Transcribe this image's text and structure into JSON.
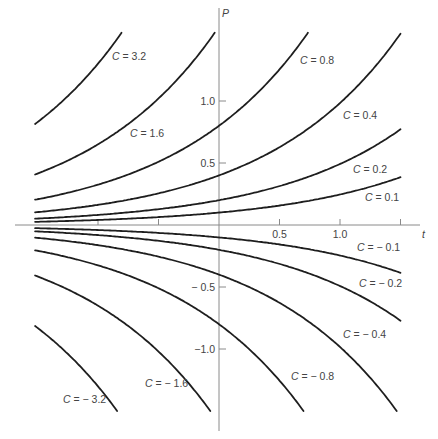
{
  "chart_data": {
    "type": "line",
    "title": "",
    "xlabel": "t",
    "ylabel": "P",
    "equation_form": "P = C·e^(k t)",
    "growth_k": 0.9,
    "xlim": [
      -1.52,
      1.5
    ],
    "ylim": [
      -1.5,
      1.55
    ],
    "x_ticks": [
      -1.0,
      -0.5,
      0.5,
      1.0,
      1.5
    ],
    "x_tick_labels": [
      {
        "value": 0.5,
        "label": "0.5"
      },
      {
        "value": 1.0,
        "label": "1.0"
      }
    ],
    "y_ticks": [
      1.0,
      0.5,
      -0.5,
      -1.0
    ],
    "y_tick_labels": [
      {
        "value": 1.0,
        "label": "1.0"
      },
      {
        "value": 0.5,
        "label": "0.5"
      },
      {
        "value": -0.5,
        "label": "− 0.5"
      },
      {
        "value": -1.0,
        "label": "−1.0"
      }
    ],
    "grid": false,
    "legend": "none (inline curve labels)",
    "series": [
      {
        "name": "C = 3.2",
        "C": 3.2,
        "label": "C = 3.2",
        "label_pos": [
          112,
          60
        ]
      },
      {
        "name": "C = 1.6",
        "C": 1.6,
        "label": "C = 1.6",
        "label_pos": [
          130,
          137
        ]
      },
      {
        "name": "C = 0.8",
        "C": 0.8,
        "label": "C = 0.8",
        "label_pos": [
          300,
          64
        ]
      },
      {
        "name": "C = 0.4",
        "C": 0.4,
        "label": "C = 0.4",
        "label_pos": [
          343,
          119
        ]
      },
      {
        "name": "C = 0.2",
        "C": 0.2,
        "label": "C = 0.2",
        "label_pos": [
          353,
          173
        ]
      },
      {
        "name": "C = 0.1",
        "C": 0.1,
        "label": "C = 0.1",
        "label_pos": [
          365,
          201
        ]
      },
      {
        "name": "C = -0.1",
        "C": -0.1,
        "label": "C = − 0.1",
        "label_pos": [
          357,
          251
        ]
      },
      {
        "name": "C = -0.2",
        "C": -0.2,
        "label": "C = − 0.2",
        "label_pos": [
          359,
          287
        ]
      },
      {
        "name": "C = -0.4",
        "C": -0.4,
        "label": "C = − 0.4",
        "label_pos": [
          343,
          338
        ]
      },
      {
        "name": "C = -0.8",
        "C": -0.8,
        "label": "C = − 0.8",
        "label_pos": [
          291,
          380
        ]
      },
      {
        "name": "C = -1.6",
        "C": -1.6,
        "label": "C = − 1.6",
        "label_pos": [
          145,
          387
        ]
      },
      {
        "name": "C = -3.2",
        "C": -3.2,
        "label": "C = − 3.2",
        "label_pos": [
          63,
          403
        ]
      }
    ]
  },
  "layout": {
    "origin_px": [
      219,
      225
    ],
    "px_per_t": 121,
    "px_per_P": 124,
    "x_axis_px": [
      15,
      420
    ],
    "y_axis_px": [
      8,
      431
    ]
  }
}
